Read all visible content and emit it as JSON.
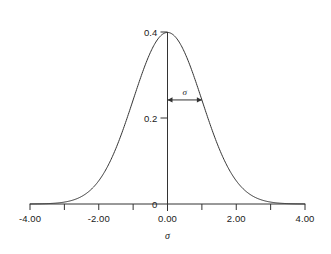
{
  "chart_data": {
    "type": "line",
    "title": "",
    "subtitle": "",
    "xlabel": "σ",
    "ylabel": "",
    "xlim": [
      -4.0,
      4.0
    ],
    "ylim": [
      0.0,
      0.4
    ],
    "grid": false,
    "legend": null,
    "legend_position": "none",
    "curve_name": "standard normal probability density",
    "formula_note": "y = (1/sqrt(2*pi)) * exp(-x^2/2)",
    "x_tick_positions": [
      -4.0,
      -3.0,
      -2.0,
      -1.0,
      0.0,
      1.0,
      2.0,
      3.0,
      4.0
    ],
    "x_tick_labels": [
      "-4.00",
      "",
      "-2.00",
      "",
      "0.00",
      "",
      "2.00",
      "",
      "4.00"
    ],
    "x_major_labels": [
      {
        "value": -4.0,
        "text": "-4.00"
      },
      {
        "value": -2.0,
        "text": "-2.00"
      },
      {
        "value": 0.0,
        "text": "0.00"
      },
      {
        "value": 2.0,
        "text": "2.00"
      },
      {
        "value": 4.0,
        "text": "4.00"
      }
    ],
    "y_tick_positions": [
      0.0,
      0.2,
      0.4
    ],
    "y_tick_labels": [
      "0",
      "0.2",
      "0.4"
    ],
    "series": [
      {
        "name": "standard normal pdf",
        "color": "#333333",
        "x": [
          -4.0,
          -3.8,
          -3.6,
          -3.4,
          -3.2,
          -3.0,
          -2.8,
          -2.6,
          -2.4,
          -2.2,
          -2.0,
          -1.8,
          -1.6,
          -1.4,
          -1.2,
          -1.0,
          -0.8,
          -0.6,
          -0.4,
          -0.2,
          0.0,
          0.2,
          0.4,
          0.6,
          0.8,
          1.0,
          1.2,
          1.4,
          1.6,
          1.8,
          2.0,
          2.2,
          2.4,
          2.6,
          2.8,
          3.0,
          3.2,
          3.4,
          3.6,
          3.8,
          4.0
        ],
        "y": [
          0.0001,
          0.0003,
          0.0006,
          0.0012,
          0.0024,
          0.0044,
          0.0079,
          0.0136,
          0.0224,
          0.0355,
          0.054,
          0.079,
          0.1109,
          0.1497,
          0.1942,
          0.242,
          0.2897,
          0.3332,
          0.3683,
          0.391,
          0.3989,
          0.391,
          0.3683,
          0.3332,
          0.2897,
          0.242,
          0.1942,
          0.1497,
          0.1109,
          0.079,
          0.054,
          0.0355,
          0.0224,
          0.0136,
          0.0079,
          0.0044,
          0.0024,
          0.0012,
          0.0006,
          0.0003,
          0.0001
        ]
      }
    ],
    "annotations": [
      {
        "name": "sigma-span-arrow",
        "label": "σ",
        "type": "double-arrow",
        "x_start": 0.0,
        "x_end": 1.0,
        "y": 0.242
      }
    ]
  },
  "axes": {
    "x_axis_name": "sigma-axis",
    "y_axis_name": "density-axis",
    "axis_color": "#333333"
  }
}
